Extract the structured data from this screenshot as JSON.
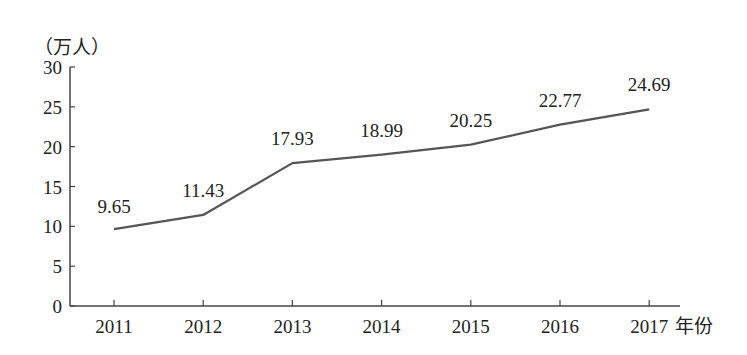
{
  "chart_data": {
    "type": "line",
    "title": "",
    "xlabel": "年份",
    "ylabel": "（万人）",
    "categories": [
      "2011",
      "2012",
      "2013",
      "2014",
      "2015",
      "2016",
      "2017"
    ],
    "values": [
      9.65,
      11.43,
      17.93,
      18.99,
      20.25,
      22.77,
      24.69
    ],
    "data_labels": [
      "9.65",
      "11.43",
      "17.93",
      "18.99",
      "20.25",
      "22.77",
      "24.69"
    ],
    "yticks": [
      "0",
      "5",
      "10",
      "15",
      "20",
      "25",
      "30"
    ],
    "ylim": [
      0,
      30
    ],
    "grid": false,
    "legend": null,
    "line_color": "#555555"
  }
}
